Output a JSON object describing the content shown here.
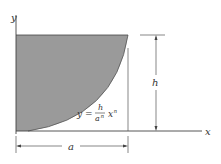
{
  "diagram": {
    "axes": {
      "x_label": "x",
      "y_label": "y"
    },
    "dimensions": {
      "height_label": "h",
      "width_label": "a"
    },
    "equation": {
      "lhs": "y =",
      "numerator": "h",
      "denominator": "a",
      "denominator_exp": "n",
      "var": "x",
      "var_exp": "n"
    },
    "colors": {
      "fill": "#9a9a9a",
      "lines": "#444444"
    }
  }
}
